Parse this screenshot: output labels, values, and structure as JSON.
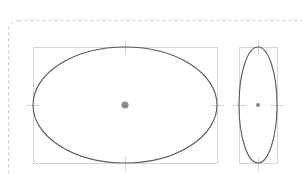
{
  "canvas": {
    "width": 302,
    "height": 174,
    "background": "#ffffff"
  },
  "page_frame": {
    "label": "page-boundary",
    "stroke": "#c9c9c9",
    "stroke_width": 1,
    "dash": "3 3",
    "corner_radius": 10,
    "x": 8,
    "y": 20,
    "width": 300,
    "height": 160
  },
  "shapes": [
    {
      "name": "ellipse-wide",
      "type": "ellipse",
      "cx": 125,
      "cy": 105,
      "rx": 92,
      "ry": 58,
      "stroke": "#595959",
      "stroke_width": 1.1,
      "fill": "none",
      "bbox": {
        "x": 33,
        "y": 47,
        "width": 184,
        "height": 116
      },
      "bbox_stroke": "#d6d6d6",
      "bbox_stroke_width": 1,
      "center_marker": {
        "name": "center-handle",
        "cx": 125,
        "cy": 105,
        "r": 3.6,
        "fill": "#8a8a8a"
      },
      "ticks": [
        {
          "name": "tick-top",
          "x1": 125,
          "y1": 40,
          "x2": 125,
          "y2": 54
        },
        {
          "name": "tick-bottom",
          "x1": 125,
          "y1": 156,
          "x2": 125,
          "y2": 170
        },
        {
          "name": "tick-left",
          "x1": 26,
          "y1": 105,
          "x2": 40,
          "y2": 105
        },
        {
          "name": "tick-right",
          "x1": 210,
          "y1": 105,
          "x2": 224,
          "y2": 105
        }
      ],
      "tick_stroke": "#d6d6d6"
    },
    {
      "name": "ellipse-narrow",
      "type": "ellipse",
      "cx": 258,
      "cy": 105,
      "rx": 19,
      "ry": 58,
      "stroke": "#595959",
      "stroke_width": 1.1,
      "fill": "none",
      "bbox": {
        "x": 239,
        "y": 47,
        "width": 38,
        "height": 116
      },
      "bbox_stroke": "#d6d6d6",
      "bbox_stroke_width": 1,
      "center_marker": {
        "name": "center-handle",
        "cx": 258,
        "cy": 105,
        "r": 2.1,
        "fill": "#8a8a8a"
      },
      "ticks": [
        {
          "name": "tick-top",
          "x1": 258,
          "y1": 40,
          "x2": 258,
          "y2": 54
        },
        {
          "name": "tick-bottom",
          "x1": 258,
          "y1": 156,
          "x2": 258,
          "y2": 170
        },
        {
          "name": "tick-left",
          "x1": 232,
          "y1": 105,
          "x2": 246,
          "y2": 105
        },
        {
          "name": "tick-right",
          "x1": 270,
          "y1": 105,
          "x2": 284,
          "y2": 105
        }
      ],
      "tick_stroke": "#d6d6d6"
    }
  ]
}
